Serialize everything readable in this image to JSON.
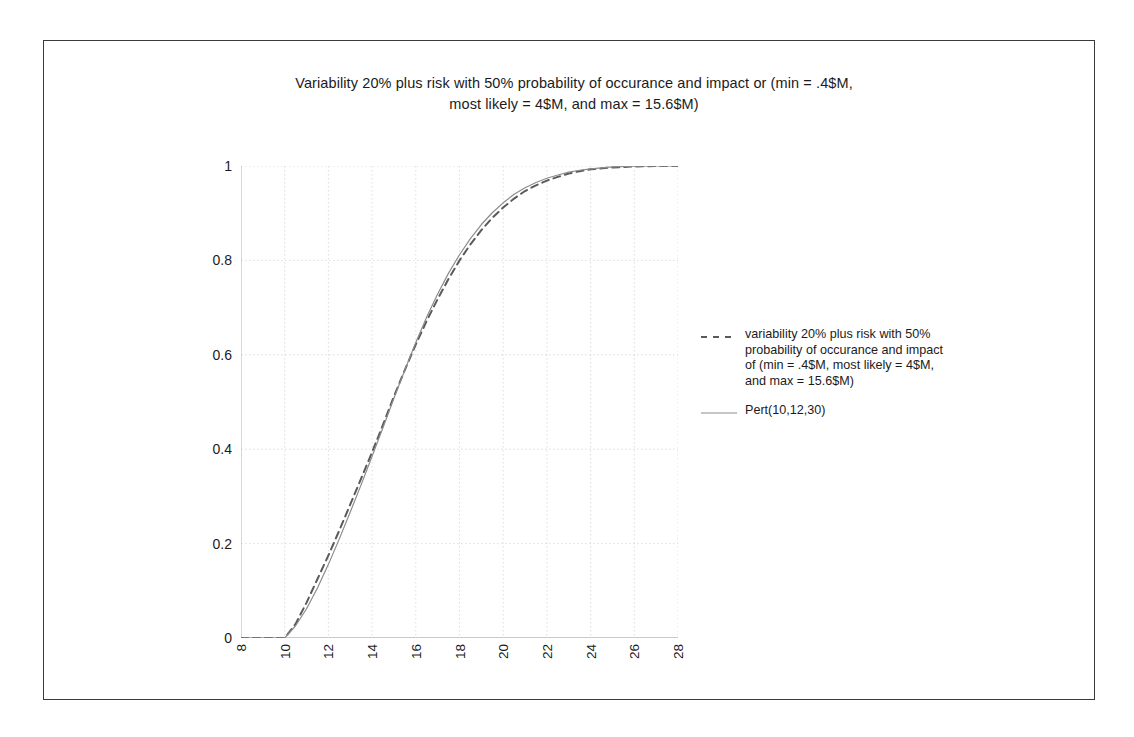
{
  "chart_data": {
    "type": "line",
    "title": "Variability 20% plus risk with 50% probability of occurance and impact or (min = .4$M, most likely = 4$M, and max = 15.6$M)",
    "title_line1": "Variability 20% plus risk with 50% probability of occurance and impact or (min = .4$M,",
    "title_line2": "most likely = 4$M, and max = 15.6$M)",
    "xlabel": "",
    "ylabel": "",
    "xlim": [
      8,
      28
    ],
    "ylim": [
      0,
      1
    ],
    "x_ticks": [
      8,
      10,
      12,
      14,
      16,
      18,
      20,
      22,
      24,
      26,
      28
    ],
    "x_tick_labels": [
      "8",
      "10",
      "12",
      "14",
      "16",
      "18",
      "20",
      "22",
      "24",
      "26",
      "28"
    ],
    "y_ticks": [
      0,
      0.2,
      0.4,
      0.6,
      0.8,
      1
    ],
    "y_tick_labels": [
      "0",
      "0.2",
      "0.4",
      "0.6",
      "0.8",
      "1"
    ],
    "grid": true,
    "grid_style": "dotted",
    "grid_color": "#d4d4d4",
    "legend_position": "right",
    "x": [
      8,
      9,
      10,
      10.5,
      11,
      11.5,
      12,
      12.5,
      13,
      13.5,
      14,
      14.5,
      15,
      15.5,
      16,
      16.5,
      17,
      17.5,
      18,
      18.5,
      19,
      19.5,
      20,
      20.5,
      21,
      21.5,
      22,
      22.5,
      23,
      23.5,
      24,
      25,
      26,
      27,
      28
    ],
    "series": [
      {
        "name": "variability 20% plus risk with 50% probability of occurance and impact of (min = .4$M, most likely = 4$M, and max = 15.6$M)",
        "style": "dashed",
        "color": "#5a5a5a",
        "values": [
          0,
          0,
          0,
          0.03,
          0.075,
          0.125,
          0.175,
          0.228,
          0.283,
          0.338,
          0.394,
          0.452,
          0.512,
          0.568,
          0.622,
          0.672,
          0.718,
          0.761,
          0.8,
          0.834,
          0.864,
          0.89,
          0.912,
          0.931,
          0.947,
          0.959,
          0.969,
          0.977,
          0.984,
          0.989,
          0.993,
          0.997,
          0.999,
          1,
          1
        ]
      },
      {
        "name": "Pert(10,12,30)",
        "style": "solid",
        "color": "#8c8c8c",
        "values": [
          0,
          0,
          0,
          0.026,
          0.062,
          0.106,
          0.156,
          0.21,
          0.267,
          0.325,
          0.385,
          0.446,
          0.508,
          0.568,
          0.626,
          0.68,
          0.729,
          0.773,
          0.812,
          0.846,
          0.876,
          0.901,
          0.922,
          0.94,
          0.954,
          0.965,
          0.974,
          0.981,
          0.987,
          0.991,
          0.994,
          0.998,
          0.9995,
          1,
          1
        ]
      }
    ],
    "legend_entries": [
      {
        "label_lines": [
          "variability 20% plus risk with 50%",
          "probability of occurance and impact",
          "of (min = .4$M, most likely = 4$M,",
          "and max = 15.6$M)"
        ],
        "style": "dashed"
      },
      {
        "label_lines": [
          "Pert(10,12,30)"
        ],
        "style": "solid"
      }
    ]
  }
}
